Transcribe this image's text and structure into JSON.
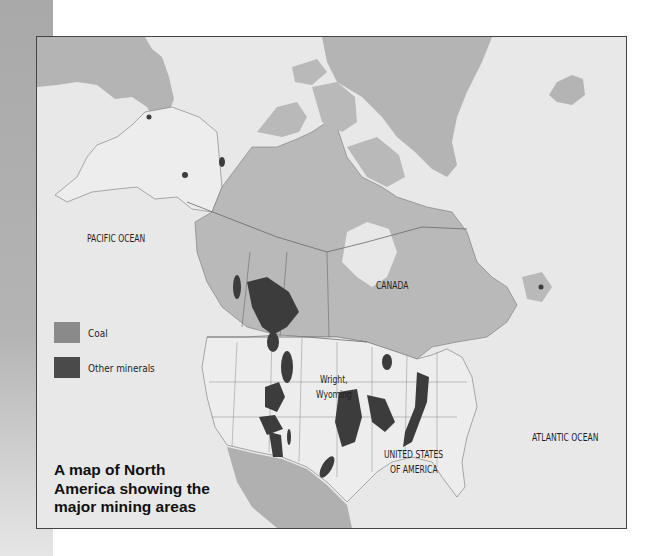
{
  "map": {
    "caption_lines": [
      "A map of North",
      "America showing the",
      "major mining areas"
    ],
    "labels": {
      "pacific": "PACIFIC OCEAN",
      "atlantic": "ATLANTIC OCEAN",
      "canada": "CANADA",
      "usa_line1": "UNITED STATES",
      "usa_line2": "OF AMERICA",
      "wright_line1": "Wright,",
      "wright_line2": "Wyoming"
    },
    "legend": [
      {
        "label": "Coal",
        "color": "#8a8a8a"
      },
      {
        "label": "Other minerals",
        "color": "#4a4a4a"
      }
    ],
    "colors": {
      "water": "#e8e8e8",
      "canada_land": "#b9b9b9",
      "usa_land": "#ededed",
      "greenland": "#b4b4b4",
      "mexico": "#b0b0b0",
      "deposit": "#3c3c3c",
      "border": "#6a6a6a"
    }
  }
}
